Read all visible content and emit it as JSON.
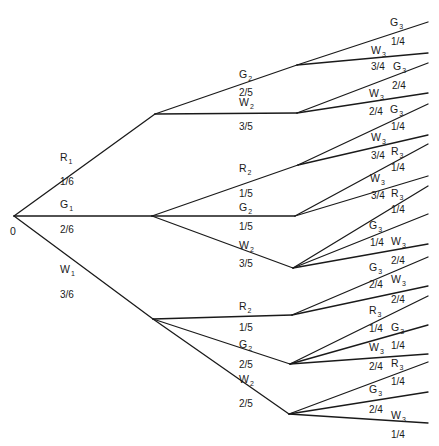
{
  "diagram": {
    "type": "probability-tree",
    "root": {
      "label": "0",
      "x": 14,
      "y": 216
    },
    "level1": [
      {
        "id": "R1",
        "letter": "R",
        "sub": "1",
        "prob": "1/6",
        "node": [
          155,
          114
        ],
        "lx": 60,
        "ly": 152,
        "px": 60,
        "py": 177
      },
      {
        "id": "G1",
        "letter": "G",
        "sub": "1",
        "prob": "2/6",
        "node": [
          152,
          216
        ],
        "lx": 60,
        "ly": 199,
        "px": 60,
        "py": 225
      },
      {
        "id": "W1",
        "letter": "W",
        "sub": "1",
        "prob": "3/6",
        "node": [
          153,
          319
        ],
        "lx": 60,
        "ly": 264,
        "px": 60,
        "py": 290
      }
    ],
    "level2": [
      {
        "id": "R1-G2",
        "parent": 0,
        "letter": "G",
        "sub": "2",
        "prob": "2/5",
        "node": [
          297,
          65
        ],
        "lx": 239,
        "ly": 69,
        "px": 239,
        "py": 88
      },
      {
        "id": "R1-W2",
        "parent": 0,
        "letter": "W",
        "sub": "2",
        "prob": "3/5",
        "node": [
          297,
          113
        ],
        "lx": 239,
        "ly": 97,
        "px": 239,
        "py": 122
      },
      {
        "id": "G1-R2",
        "parent": 1,
        "letter": "R",
        "sub": "2",
        "prob": "1/5",
        "node": [
          298,
          165
        ],
        "lx": 239,
        "ly": 163,
        "px": 239,
        "py": 189
      },
      {
        "id": "G1-G2",
        "parent": 1,
        "letter": "G",
        "sub": "2",
        "prob": "1/5",
        "node": [
          295,
          216
        ],
        "lx": 239,
        "ly": 202,
        "px": 239,
        "py": 222
      },
      {
        "id": "G1-W2",
        "parent": 1,
        "letter": "W",
        "sub": "2",
        "prob": "3/5",
        "node": [
          293,
          268
        ],
        "lx": 239,
        "ly": 240,
        "px": 239,
        "py": 259
      },
      {
        "id": "W1-R2",
        "parent": 2,
        "letter": "R",
        "sub": "2",
        "prob": "1/5",
        "node": [
          292,
          315
        ],
        "lx": 239,
        "ly": 301,
        "px": 239,
        "py": 323
      },
      {
        "id": "W1-G2",
        "parent": 2,
        "letter": "G",
        "sub": "2",
        "prob": "2/5",
        "node": [
          290,
          364
        ],
        "lx": 239,
        "ly": 339,
        "px": 239,
        "py": 360
      },
      {
        "id": "W1-W2",
        "parent": 2,
        "letter": "W",
        "sub": "2",
        "prob": "2/5",
        "node": [
          289,
          414
        ],
        "lx": 239,
        "ly": 374,
        "px": 239,
        "py": 399
      }
    ],
    "level3": [
      {
        "parent": 0,
        "letter": "G",
        "sub": "3",
        "prob": "1/4",
        "end": [
          428,
          22
        ],
        "lx": 390,
        "ly": 17,
        "px": 391,
        "py": 37
      },
      {
        "parent": 0,
        "letter": "W",
        "sub": "3",
        "prob": "3/4",
        "end": [
          428,
          53
        ],
        "lx": 371,
        "ly": 45,
        "px": 371,
        "py": 62
      },
      {
        "parent": 1,
        "letter": "G",
        "sub": "3",
        "prob": "2/4",
        "end": [
          428,
          63
        ],
        "lx": 393,
        "ly": 61,
        "px": 392,
        "py": 81
      },
      {
        "parent": 1,
        "letter": "W",
        "sub": "3",
        "prob": "2/4",
        "end": [
          428,
          93
        ],
        "lx": 369,
        "ly": 88,
        "px": 369,
        "py": 107
      },
      {
        "parent": 2,
        "letter": "G",
        "sub": "3",
        "prob": "1/4",
        "end": [
          428,
          104
        ],
        "lx": 390,
        "ly": 104,
        "px": 391,
        "py": 122
      },
      {
        "parent": 2,
        "letter": "W",
        "sub": "3",
        "prob": "3/4",
        "end": [
          428,
          135
        ],
        "lx": 371,
        "ly": 132,
        "px": 371,
        "py": 151
      },
      {
        "parent": 3,
        "letter": "R",
        "sub": "3",
        "prob": "1/4",
        "end": [
          428,
          144
        ],
        "lx": 391,
        "ly": 146,
        "px": 391,
        "py": 163
      },
      {
        "parent": 3,
        "letter": "W",
        "sub": "3",
        "prob": "3/4",
        "end": [
          428,
          176
        ],
        "lx": 370,
        "ly": 173,
        "px": 371,
        "py": 191
      },
      {
        "parent": 4,
        "letter": "R",
        "sub": "3",
        "prob": "1/4",
        "end": [
          428,
          186
        ],
        "lx": 391,
        "ly": 188,
        "px": 391,
        "py": 205
      },
      {
        "parent": 4,
        "letter": "G",
        "sub": "3",
        "prob": "1/4",
        "end": [
          428,
          214
        ],
        "lx": 369,
        "ly": 220,
        "px": 370,
        "py": 238
      },
      {
        "parent": 4,
        "letter": "W",
        "sub": "3",
        "prob": "2/4",
        "end": [
          428,
          244
        ],
        "lx": 391,
        "ly": 236,
        "px": 391,
        "py": 256
      },
      {
        "parent": 5,
        "letter": "G",
        "sub": "3",
        "prob": "2/4",
        "end": [
          428,
          257
        ],
        "lx": 369,
        "ly": 262,
        "px": 369,
        "py": 280
      },
      {
        "parent": 5,
        "letter": "W",
        "sub": "3",
        "prob": "2/4",
        "end": [
          428,
          286
        ],
        "lx": 391,
        "ly": 274,
        "px": 391,
        "py": 295
      },
      {
        "parent": 6,
        "letter": "R",
        "sub": "3",
        "prob": "1/4",
        "end": [
          428,
          296
        ],
        "lx": 369,
        "ly": 305,
        "px": 369,
        "py": 324
      },
      {
        "parent": 6,
        "letter": "G",
        "sub": "3",
        "prob": "1/4",
        "end": [
          428,
          325
        ],
        "lx": 391,
        "ly": 322,
        "px": 391,
        "py": 341
      },
      {
        "parent": 6,
        "letter": "W",
        "sub": "3",
        "prob": "2/4",
        "end": [
          428,
          354
        ],
        "lx": 369,
        "ly": 342,
        "px": 369,
        "py": 362
      },
      {
        "parent": 7,
        "letter": "R",
        "sub": "3",
        "prob": "1/4",
        "end": [
          428,
          362
        ],
        "lx": 391,
        "ly": 358,
        "px": 391,
        "py": 377
      },
      {
        "parent": 7,
        "letter": "G",
        "sub": "3",
        "prob": "2/4",
        "end": [
          428,
          392
        ],
        "lx": 369,
        "ly": 384,
        "px": 369,
        "py": 405
      },
      {
        "parent": 7,
        "letter": "W",
        "sub": "3",
        "prob": "1/4",
        "end": [
          428,
          423
        ],
        "lx": 391,
        "ly": 410,
        "px": 391,
        "py": 430
      }
    ]
  }
}
